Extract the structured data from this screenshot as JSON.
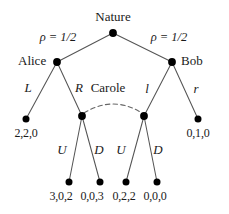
{
  "figure": {
    "type": "game-tree"
  },
  "colors": {
    "node_fill": "#000000",
    "edge": "#555555",
    "text": "#1a1a1a",
    "infoset_arc": "#666666",
    "background": "#ffffff"
  },
  "players": {
    "nature": "Nature",
    "alice": "Alice",
    "bob": "Bob",
    "carole": "Carole"
  },
  "probabilities": {
    "left": "ρ = 1/2",
    "right": "ρ = 1/2"
  },
  "actions": {
    "alice_left": "L",
    "alice_right": "R",
    "bob_left": "l",
    "bob_right": "r",
    "carole_left_up": "U",
    "carole_left_down": "D",
    "carole_right_up": "U",
    "carole_right_down": "D"
  },
  "payoffs": {
    "alice_L": "2,2,0",
    "carole_left_U": "3,0,2",
    "carole_left_D": "0,0,3",
    "carole_right_U": "0,2,2",
    "carole_right_D": "0,0,0",
    "bob_r": "0,1,0"
  },
  "nodes": {
    "root": {
      "x": 113,
      "y": 33,
      "label": "Nature"
    },
    "alice": {
      "x": 57,
      "y": 62,
      "label": "Alice"
    },
    "bob": {
      "x": 172,
      "y": 62,
      "label": "Bob"
    },
    "carole_left": {
      "x": 82,
      "y": 116
    },
    "carole_right": {
      "x": 144,
      "y": 116
    },
    "terminal_left": {
      "x": 26,
      "y": 119
    },
    "terminal_right": {
      "x": 198,
      "y": 119
    },
    "terminal_b1": {
      "x": 69,
      "y": 182
    },
    "terminal_b2": {
      "x": 100,
      "y": 182
    },
    "terminal_b3": {
      "x": 126,
      "y": 182
    },
    "terminal_b4": {
      "x": 157,
      "y": 182
    }
  },
  "info_set": {
    "style": "dashed-arc",
    "connects": [
      "carole_left",
      "carole_right"
    ],
    "owner": "Carole"
  }
}
